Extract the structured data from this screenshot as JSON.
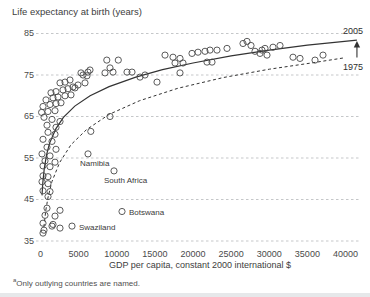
{
  "chart": {
    "title": "Life expectancy at birth (years)",
    "x_axis": {
      "label": "GDP per capita, constant 2000 international $",
      "ticks": [
        "0",
        "5000",
        "10000",
        "15000",
        "20000",
        "25000",
        "30000",
        "35000",
        "40000"
      ]
    },
    "y_axis": {
      "ticks": [
        "85",
        "75",
        "65",
        "55",
        "45",
        "35"
      ]
    },
    "series_labels": {
      "solid": "2005",
      "dashed": "1975"
    },
    "footnote_marker": "a",
    "footnote": "Only outlying countries are named."
  },
  "colors": {
    "background": "#ffffff",
    "text": "#3d3d3d",
    "gridline": "#c5c7c9",
    "point_stroke": "#4a4a4a",
    "curve": "#333333",
    "bottom_bar": "#e6e8ea"
  },
  "chart_data": {
    "type": "scatter",
    "title": "Life expectancy at birth (years)",
    "xlabel": "GDP per capita, constant 2000 international $",
    "ylabel": "Life expectancy at birth (years)",
    "xlim": [
      0,
      42500
    ],
    "ylim": [
      35,
      85
    ],
    "grid": "horizontal-dashed",
    "points": [
      [
        980,
        61.2
      ],
      [
        1900,
        60.7
      ],
      [
        330,
        59.5
      ],
      [
        1510,
        59.0
      ],
      [
        850,
        57.6
      ],
      [
        2030,
        57.1
      ],
      [
        200,
        56.0
      ],
      [
        1250,
        55.5
      ],
      [
        590,
        54.3
      ],
      [
        1900,
        54.0
      ],
      [
        330,
        53.1
      ],
      [
        1250,
        52.9
      ],
      [
        330,
        50.7
      ],
      [
        980,
        50.5
      ],
      [
        200,
        49.3
      ],
      [
        980,
        48.8
      ],
      [
        330,
        47.1
      ],
      [
        1250,
        46.9
      ],
      [
        980,
        45.7
      ],
      [
        850,
        42.9
      ],
      [
        2560,
        42.4
      ],
      [
        590,
        41.2
      ],
      [
        1900,
        41.0
      ],
      [
        330,
        39.3
      ],
      [
        1510,
        38.6
      ],
      [
        460,
        37.6
      ],
      [
        330,
        36.9
      ],
      [
        1640,
        39.0
      ],
      [
        2560,
        38.1
      ],
      [
        8700,
        78.6
      ],
      [
        10200,
        78.6
      ],
      [
        9110,
        76.7
      ],
      [
        9510,
        75.7
      ],
      [
        11340,
        75.7
      ],
      [
        12000,
        75.7
      ],
      [
        6490,
        76.2
      ],
      [
        8460,
        75.5
      ],
      [
        5570,
        75.0
      ],
      [
        6100,
        74.8
      ],
      [
        5310,
        75.5
      ],
      [
        6230,
        75.7
      ],
      [
        2560,
        73.1
      ],
      [
        3210,
        73.3
      ],
      [
        3870,
        73.8
      ],
      [
        4260,
        72.1
      ],
      [
        4920,
        72.6
      ],
      [
        5840,
        73.1
      ],
      [
        1380,
        70.7
      ],
      [
        2030,
        71.0
      ],
      [
        2950,
        71.4
      ],
      [
        3610,
        71.7
      ],
      [
        4520,
        71.9
      ],
      [
        720,
        69.0
      ],
      [
        1640,
        69.5
      ],
      [
        2300,
        69.7
      ],
      [
        3210,
        70.0
      ],
      [
        4000,
        70.2
      ],
      [
        330,
        67.4
      ],
      [
        1250,
        67.9
      ],
      [
        2030,
        68.1
      ],
      [
        2690,
        68.3
      ],
      [
        150,
        66.0
      ],
      [
        980,
        66.2
      ],
      [
        1900,
        66.4
      ],
      [
        460,
        64.8
      ],
      [
        1510,
        64.3
      ],
      [
        2560,
        63.8
      ],
      [
        850,
        62.9
      ],
      [
        2030,
        62.4
      ],
      [
        9110,
        65.0
      ],
      [
        6600,
        61.4
      ],
      [
        13050,
        74.5
      ],
      [
        13700,
        75.0
      ],
      [
        15280,
        73.3
      ],
      [
        16330,
        79.8
      ],
      [
        17380,
        79.3
      ],
      [
        18300,
        79.0
      ],
      [
        17640,
        77.9
      ],
      [
        18690,
        77.9
      ],
      [
        18300,
        75.5
      ],
      [
        19870,
        80.2
      ],
      [
        20660,
        80.5
      ],
      [
        21570,
        80.7
      ],
      [
        22230,
        81.0
      ],
      [
        23150,
        81.0
      ],
      [
        24460,
        81.4
      ],
      [
        21840,
        78.1
      ],
      [
        22490,
        78.1
      ],
      [
        26560,
        82.6
      ],
      [
        27080,
        83.1
      ],
      [
        27610,
        82.1
      ],
      [
        28130,
        80.7
      ],
      [
        28790,
        80.2
      ],
      [
        29050,
        81.0
      ],
      [
        29440,
        81.4
      ],
      [
        29700,
        79.8
      ],
      [
        30490,
        81.7
      ],
      [
        31410,
        82.1
      ],
      [
        33110,
        79.3
      ],
      [
        34030,
        79.0
      ],
      [
        36000,
        78.6
      ],
      [
        37050,
        79.8
      ]
    ],
    "named_points": [
      {
        "name": "Namibia",
        "x": 6230,
        "y": 56.0,
        "label_left": 80,
        "label_top": 159
      },
      {
        "name": "South Africa",
        "x": 9640,
        "y": 51.9,
        "label_left": 104,
        "label_top": 176
      },
      {
        "name": "Botswana",
        "x": 10690,
        "y": 42.1,
        "label_left": 129,
        "label_top": 208
      },
      {
        "name": "Swaziland",
        "x": 4130,
        "y": 38.6,
        "label_left": 79,
        "label_top": 223
      }
    ],
    "curves": [
      {
        "name": "2005",
        "style": "solid",
        "points": [
          [
            200,
            46.0
          ],
          [
            300,
            49.0
          ],
          [
            500,
            52.5
          ],
          [
            800,
            55.8
          ],
          [
            1200,
            58.6
          ],
          [
            2000,
            62.0
          ],
          [
            3000,
            64.8
          ],
          [
            4500,
            67.5
          ],
          [
            6500,
            70.0
          ],
          [
            9000,
            72.2
          ],
          [
            12500,
            74.5
          ],
          [
            16000,
            76.3
          ],
          [
            20000,
            77.9
          ],
          [
            25000,
            79.6
          ],
          [
            30000,
            81.0
          ],
          [
            35000,
            82.2
          ],
          [
            41500,
            83.4
          ]
        ]
      },
      {
        "name": "1975",
        "style": "dashed",
        "points": [
          [
            450,
            38.4
          ],
          [
            700,
            42.4
          ],
          [
            1000,
            45.6
          ],
          [
            1500,
            49.3
          ],
          [
            2500,
            53.9
          ],
          [
            4000,
            58.2
          ],
          [
            6000,
            61.8
          ],
          [
            9000,
            65.5
          ],
          [
            13000,
            68.8
          ],
          [
            18000,
            71.8
          ],
          [
            24000,
            74.4
          ],
          [
            30000,
            76.4
          ],
          [
            35500,
            77.9
          ],
          [
            39700,
            79.1
          ]
        ]
      }
    ],
    "arrow": {
      "x": 41500,
      "from": 79.2,
      "to": 83.2
    },
    "legend_position": "curve-end-labels"
  }
}
